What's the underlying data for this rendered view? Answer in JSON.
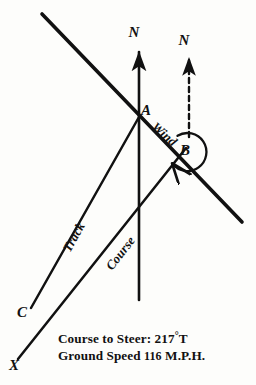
{
  "figure": {
    "kind": "wind-triangle-navigation-diagram",
    "background_color": "#fdfdfb",
    "ink_color": "#111111"
  },
  "points": {
    "a": "A",
    "b": "B",
    "c": "C",
    "x": "X"
  },
  "north_markers": {
    "true_north_solid": "N",
    "true_north_dashed": "N"
  },
  "segments": {
    "wind": "Wind",
    "track": "Track",
    "course": "Course"
  },
  "caption": {
    "line1_prefix": "Course to Steer: ",
    "line1_value": "217",
    "line1_degree": "°",
    "line1_suffix": "T",
    "line2_prefix": "Ground Speed ",
    "line2_value": "116",
    "line2_suffix": " M.P.H.",
    "course_to_steer_full": "Course to Steer: 217°T",
    "ground_speed_full": "Ground Speed 116 M.P.H."
  },
  "geometry": {
    "point_a": [
      139,
      117
    ],
    "point_b": [
      186,
      148
    ],
    "point_c": [
      30,
      310
    ],
    "point_x": [
      18,
      361
    ],
    "diagonal_start": [
      42,
      14
    ],
    "diagonal_end": [
      242,
      222
    ],
    "north_solid_top": [
      139,
      47
    ],
    "north_solid_bottom": [
      139,
      300
    ],
    "north_dashed_top": [
      189,
      52
    ],
    "north_dashed_bottom": [
      189,
      137
    ],
    "arc_center": [
      188,
      152
    ],
    "arc_radius": 19
  }
}
